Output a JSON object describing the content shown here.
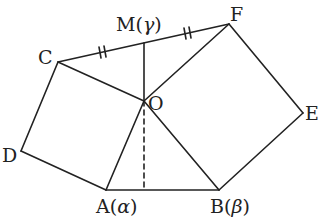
{
  "diagram": {
    "points": {
      "A": {
        "label": "A",
        "param": "α",
        "x": 106,
        "y": 190
      },
      "B": {
        "label": "B",
        "param": "β",
        "x": 219,
        "y": 190
      },
      "C": {
        "label": "C",
        "x": 58,
        "y": 62
      },
      "D": {
        "label": "D",
        "x": 21,
        "y": 151
      },
      "E": {
        "label": "E",
        "x": 303,
        "y": 113
      },
      "F": {
        "label": "F",
        "x": 229,
        "y": 24
      },
      "M": {
        "label": "M",
        "param": "γ",
        "x": 144,
        "y": 43
      },
      "O": {
        "label": "O",
        "x": 144,
        "y": 101
      }
    },
    "labels": {
      "A": "A",
      "A_param": "α",
      "B": "B",
      "B_param": "β",
      "C": "C",
      "D": "D",
      "E": "E",
      "F": "F",
      "M": "M",
      "M_param": "γ",
      "O": "O",
      "open": "(",
      "close": ")"
    },
    "segments": [
      "C-F",
      "C-D",
      "D-A",
      "A-B",
      "B-E",
      "E-F",
      "C-O",
      "F-O",
      "A-O",
      "B-O",
      "M-O"
    ],
    "dashed_segments": [
      "O-foot(AB)"
    ],
    "equal_marks": [
      "C-M",
      "M-F"
    ],
    "stroke_color": "#222222"
  }
}
